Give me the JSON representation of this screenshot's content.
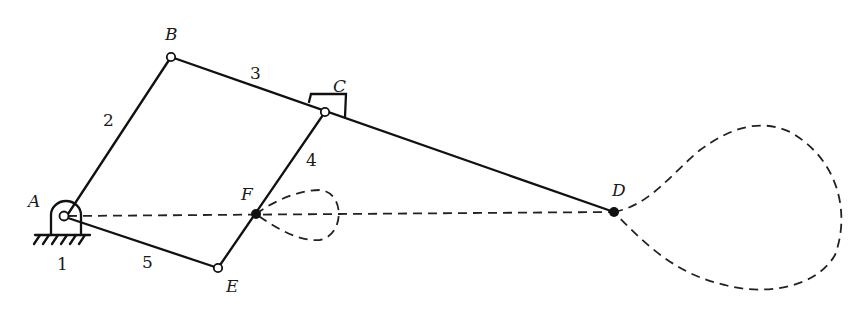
{
  "diagram": {
    "type": "planar linkage mechanism with coupler curves",
    "points": {
      "A": {
        "label": "A",
        "kind": "fixed pivot"
      },
      "B": {
        "label": "B",
        "kind": "revolute joint"
      },
      "C": {
        "label": "C",
        "kind": "revolute joint with slider"
      },
      "D": {
        "label": "D",
        "kind": "tracing point"
      },
      "E": {
        "label": "E",
        "kind": "revolute joint"
      },
      "F": {
        "label": "F",
        "kind": "tracing point"
      }
    },
    "links": {
      "l1": {
        "label": "1",
        "name": "ground / frame"
      },
      "l2": {
        "label": "2",
        "name": "link AB"
      },
      "l3": {
        "label": "3",
        "name": "link BD"
      },
      "l4": {
        "label": "4",
        "name": "link CE"
      },
      "l5": {
        "label": "5",
        "name": "link AE"
      }
    },
    "curves": [
      {
        "name": "coupler curve of F",
        "style": "dashed loop"
      },
      {
        "name": "coupler curve of D",
        "style": "dashed loop"
      },
      {
        "name": "line AD",
        "style": "dashed straight line"
      }
    ]
  }
}
